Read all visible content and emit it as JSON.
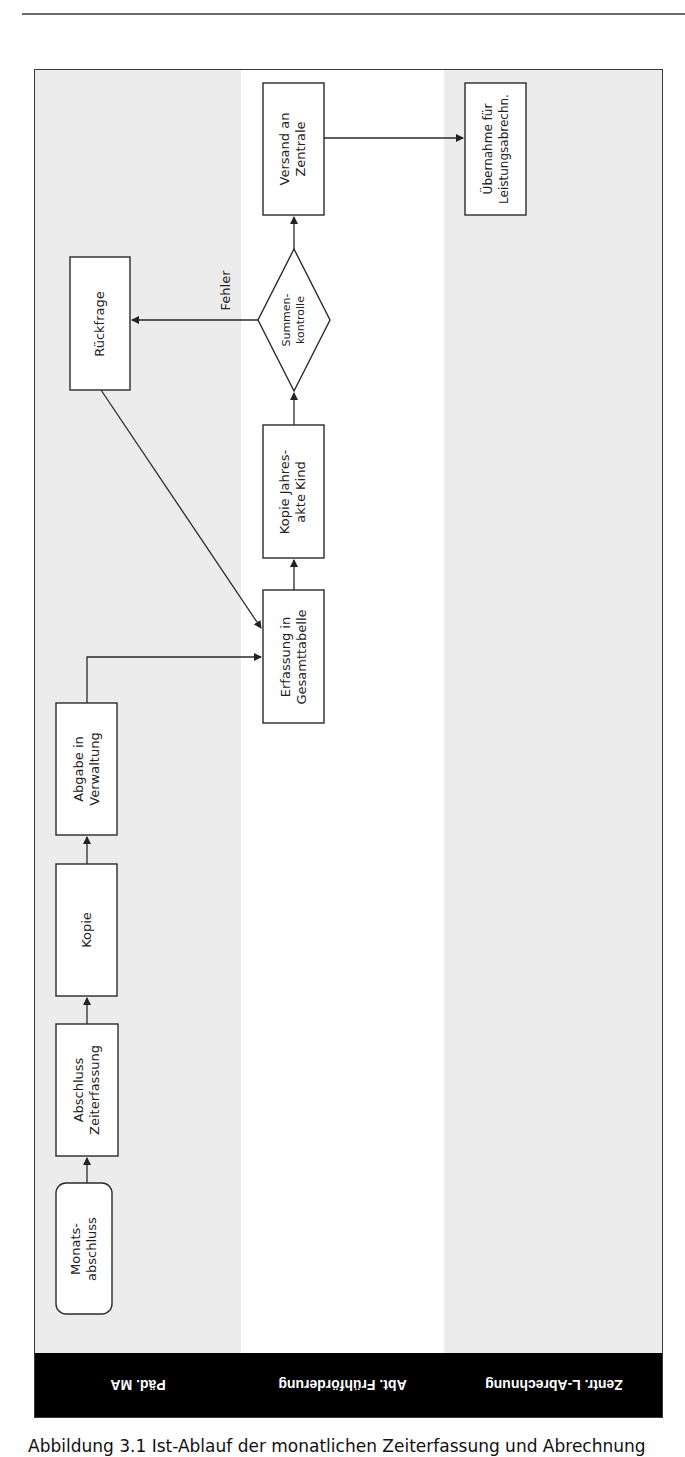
{
  "diagram": {
    "type": "swimlane-flowchart",
    "orientation": "rotated-90",
    "lanes": [
      {
        "id": "paed",
        "label": "Päd. MA",
        "fill": "#ececec"
      },
      {
        "id": "abt",
        "label": "Abt. Frühförderung",
        "fill": "#ffffff"
      },
      {
        "id": "zentr",
        "label": "Zentr. L-Abrechnung",
        "fill": "#ececec"
      }
    ],
    "nodes": [
      {
        "id": "n1",
        "lane": "paed",
        "shape": "rounded-rect",
        "text": "Monats-\nabschluss"
      },
      {
        "id": "n2",
        "lane": "paed",
        "shape": "rect",
        "text": "Abschluss\nZeiterfassung"
      },
      {
        "id": "n3",
        "lane": "paed",
        "shape": "rect",
        "text": "Kopie"
      },
      {
        "id": "n4",
        "lane": "paed",
        "shape": "rect",
        "text": "Abgabe in\nVerwaltung"
      },
      {
        "id": "n5",
        "lane": "abt",
        "shape": "rect",
        "text": "Erfassung in\nGesamttabelle"
      },
      {
        "id": "n6",
        "lane": "abt",
        "shape": "rect",
        "text": "Kopie Jahres-\nakte Kind"
      },
      {
        "id": "n7",
        "lane": "abt",
        "shape": "diamond",
        "text": "Summen-\nkontrolle"
      },
      {
        "id": "n8",
        "lane": "paed",
        "shape": "rect",
        "text": "Rückfrage"
      },
      {
        "id": "n9",
        "lane": "abt",
        "shape": "rect",
        "text": "Versand an\nZentrale"
      },
      {
        "id": "n10",
        "lane": "zentr",
        "shape": "rect",
        "text": "Übernahme für\nLeistungsabrechn."
      }
    ],
    "edges": [
      {
        "from": "n1",
        "to": "n2",
        "label": ""
      },
      {
        "from": "n2",
        "to": "n3",
        "label": ""
      },
      {
        "from": "n3",
        "to": "n4",
        "label": ""
      },
      {
        "from": "n4",
        "to": "n5",
        "label": ""
      },
      {
        "from": "n5",
        "to": "n6",
        "label": ""
      },
      {
        "from": "n6",
        "to": "n7",
        "label": ""
      },
      {
        "from": "n7",
        "to": "n8",
        "label": "Fehler"
      },
      {
        "from": "n8",
        "to": "n5",
        "label": ""
      },
      {
        "from": "n7",
        "to": "n9",
        "label": ""
      },
      {
        "from": "n9",
        "to": "n10",
        "label": ""
      }
    ],
    "edge_label_fehler": "Fehler"
  },
  "caption": "Abbildung 3.1  Ist-Ablauf der monatlichen Zeiterfassung und Abrechnung"
}
